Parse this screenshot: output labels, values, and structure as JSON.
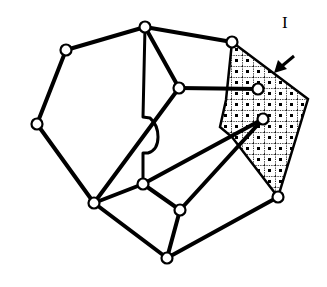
{
  "diagram": {
    "type": "graph",
    "region_label": "I",
    "colors": {
      "stroke": "#000000",
      "node_fill": "#ffffff",
      "background": "#ffffff"
    },
    "nodes": [
      {
        "id": "n_top",
        "x": 145,
        "y": 27
      },
      {
        "id": "n_upper_left",
        "x": 66,
        "y": 50
      },
      {
        "id": "n_left",
        "x": 37,
        "y": 124
      },
      {
        "id": "n_bottom_left",
        "x": 94,
        "y": 203
      },
      {
        "id": "n_bottom",
        "x": 167,
        "y": 258
      },
      {
        "id": "n_right_bottom",
        "x": 278,
        "y": 197
      },
      {
        "id": "n_top_right",
        "x": 232,
        "y": 42
      },
      {
        "id": "n_inner",
        "x": 179,
        "y": 88
      },
      {
        "id": "n_shaded_1",
        "x": 258,
        "y": 89
      },
      {
        "id": "n_shaded_2",
        "x": 263,
        "y": 119
      },
      {
        "id": "n_center",
        "x": 143,
        "y": 184
      },
      {
        "id": "n_lower_center",
        "x": 180,
        "y": 210
      }
    ],
    "edges": [
      [
        "n_top",
        "n_upper_left"
      ],
      [
        "n_upper_left",
        "n_left"
      ],
      [
        "n_left",
        "n_bottom_left"
      ],
      [
        "n_bottom_left",
        "n_bottom"
      ],
      [
        "n_bottom",
        "n_right_bottom"
      ],
      [
        "n_top",
        "n_top_right"
      ],
      [
        "n_top",
        "n_inner"
      ],
      [
        "n_inner",
        "n_shaded_1"
      ],
      [
        "n_inner",
        "n_bottom_left"
      ],
      [
        "n_bottom_left",
        "n_center"
      ],
      [
        "n_center",
        "n_lower_center"
      ],
      [
        "n_lower_center",
        "n_bottom"
      ],
      [
        "n_center",
        "n_shaded_2"
      ],
      [
        "n_lower_center",
        "n_shaded_2"
      ]
    ],
    "shaded_region": {
      "name": "region-I",
      "points": "232,42 308,99 278,197 232,137 220,127 226,100"
    }
  }
}
